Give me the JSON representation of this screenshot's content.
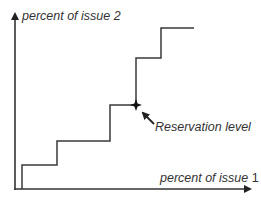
{
  "diagram": {
    "type": "staircase-utility-diagram",
    "y_axis_label": "percent of issue 2",
    "x_axis_label_text": "percent of issue ",
    "x_axis_label_number": "1",
    "annotation": "Reservation level",
    "marker_icon": "star-marker",
    "colors": {
      "line": "#3a3a3a",
      "text": "#333333",
      "background": "#ffffff"
    },
    "steps_description": "Five-step ascending staircase; reservation level marked at the corner of the fourth riser"
  }
}
